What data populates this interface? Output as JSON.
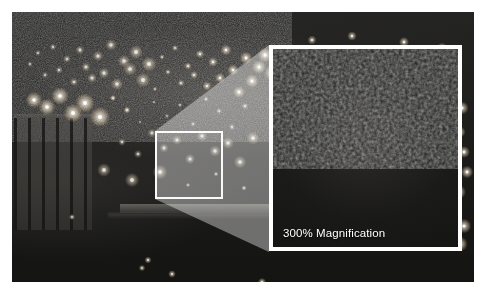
{
  "viewer": {
    "title": "Night Surveillance Still — Magnified Detail",
    "background_color": "#ffffff"
  },
  "photo": {
    "name": "night-cityscape-photo",
    "description": "Dark grainy night-time long-lens photograph of a cityscape with scattered point lights",
    "base_color": "#1d1d1c",
    "regions": [
      {
        "name": "building-facade",
        "label": "building facade with vertical window columns"
      },
      {
        "name": "light-field",
        "label": "scattered city light field"
      },
      {
        "name": "horizontal-band",
        "label": "illuminated horizontal band"
      }
    ]
  },
  "selection": {
    "name": "selection-box",
    "border_color": "#ffffff",
    "border_width_px": 2
  },
  "cone": {
    "name": "magnification-cone",
    "fill_color": "#ffffff",
    "opacity": 0.38
  },
  "magnifier": {
    "name": "magnification-panel",
    "label": "300% Magnification",
    "magnification_percent": "300%",
    "border_color": "#ffffff",
    "border_width_px": 4,
    "label_color": "#ffffff"
  },
  "chart_data": {
    "type": "scatter",
    "xlabel": "",
    "ylabel": "",
    "annotations": [
      "300% Magnification"
    ],
    "legend": [],
    "series": [
      {
        "name": "city-lights",
        "points": [
          [
            18,
            52
          ],
          [
            26,
            41
          ],
          [
            33,
            63
          ],
          [
            41,
            35
          ],
          [
            47,
            58
          ],
          [
            55,
            47
          ],
          [
            62,
            70
          ],
          [
            68,
            38
          ],
          [
            74,
            55
          ],
          [
            80,
            66
          ],
          [
            86,
            44
          ],
          [
            92,
            61
          ],
          [
            99,
            33
          ],
          [
            105,
            72
          ],
          [
            112,
            49
          ],
          [
            118,
            57
          ],
          [
            124,
            40
          ],
          [
            131,
            68
          ],
          [
            137,
            52
          ],
          [
            143,
            77
          ],
          [
            150,
            45
          ],
          [
            156,
            60
          ],
          [
            163,
            36
          ],
          [
            169,
            71
          ],
          [
            176,
            54
          ],
          [
            182,
            63
          ],
          [
            188,
            42
          ],
          [
            195,
            74
          ],
          [
            201,
            50
          ],
          [
            208,
            66
          ],
          [
            214,
            38
          ],
          [
            221,
            58
          ],
          [
            227,
            80
          ],
          [
            234,
            46
          ],
          [
            240,
            69
          ],
          [
            247,
            55
          ],
          [
            253,
            43
          ],
          [
            260,
            61
          ],
          [
            22,
            88
          ],
          [
            35,
            95
          ],
          [
            48,
            84
          ],
          [
            61,
            101
          ],
          [
            73,
            91
          ],
          [
            88,
            105
          ],
          [
            101,
            86
          ],
          [
            115,
            98
          ],
          [
            128,
            110
          ],
          [
            142,
            90
          ],
          [
            155,
            104
          ],
          [
            168,
            93
          ],
          [
            181,
            112
          ],
          [
            194,
            87
          ],
          [
            207,
            99
          ],
          [
            220,
            115
          ],
          [
            233,
            94
          ],
          [
            110,
            130
          ],
          [
            126,
            142
          ],
          [
            140,
            121
          ],
          [
            152,
            136
          ],
          [
            165,
            128
          ],
          [
            178,
            147
          ],
          [
            190,
            124
          ],
          [
            203,
            139
          ],
          [
            216,
            131
          ],
          [
            228,
            150
          ],
          [
            241,
            126
          ],
          [
            92,
            158
          ],
          [
            120,
            168
          ],
          [
            148,
            160
          ],
          [
            176,
            173
          ],
          [
            204,
            162
          ],
          [
            232,
            176
          ],
          [
            60,
            205
          ],
          [
            130,
            256
          ],
          [
            136,
            248
          ],
          [
            160,
            262
          ],
          [
            250,
            270
          ],
          [
            300,
            28
          ],
          [
            340,
            24
          ],
          [
            392,
            30
          ],
          [
            430,
            36
          ],
          [
            448,
            120
          ],
          [
            452,
            140
          ],
          [
            455,
            160
          ],
          [
            450,
            96
          ],
          [
            447,
            180
          ],
          [
            452,
            214
          ],
          [
            448,
            232
          ]
        ]
      }
    ]
  }
}
